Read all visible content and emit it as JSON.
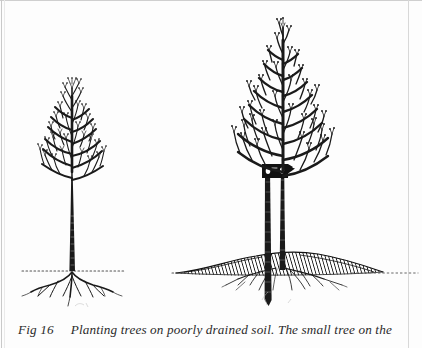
{
  "figure": {
    "label": "Fig 16",
    "caption_text": "Planting trees on poorly drained soil. The small tree on the",
    "ink_color": "#1a1a1a",
    "paper_color": "#fdfdfd",
    "left_tree": {
      "name": "small tree planted at ground level",
      "ground_line_style": "dotted",
      "has_stake": false,
      "has_mound": false
    },
    "right_tree": {
      "name": "large tree staked and planted on raised mound",
      "ground_line_style": "dotted",
      "has_stake": true,
      "has_mound": true,
      "tie_label": "tree tie"
    }
  }
}
